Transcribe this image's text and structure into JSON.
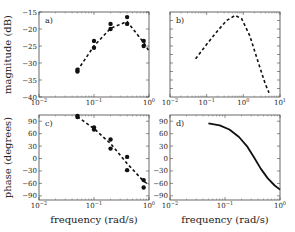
{
  "chart_data": [
    {
      "panel": "a)",
      "type": "scatter",
      "xscale": "log",
      "xlim": [
        0.01,
        1
      ],
      "ylim": [
        -40,
        -15
      ],
      "xticks": [
        "10^-2",
        "10^-1",
        "10^0"
      ],
      "yticks": [
        -40,
        -35,
        -30,
        -25,
        -20,
        -15
      ],
      "ylabel": "magnitude (dB)",
      "xlabel": "",
      "series": [
        {
          "name": "measured",
          "style": "points",
          "x": [
            0.05,
            0.05,
            0.1,
            0.1,
            0.2,
            0.2,
            0.4,
            0.4,
            0.8,
            0.8
          ],
          "y": [
            -32.5,
            -32.0,
            -25.5,
            -23.5,
            -20.0,
            -18.5,
            -16.5,
            -18.5,
            -23.5,
            -25.0
          ]
        },
        {
          "name": "fit",
          "style": "dashed",
          "x": [
            0.05,
            0.1,
            0.2,
            0.4,
            0.8,
            1.0
          ],
          "y": [
            -32.2,
            -25.0,
            -19.8,
            -17.8,
            -24.0,
            -26.5
          ]
        }
      ]
    },
    {
      "panel": "b)",
      "type": "line",
      "xscale": "log",
      "xlim": [
        0.01,
        10
      ],
      "ylim": [
        0,
        1
      ],
      "xticks": [
        "10^-2",
        "10^-1",
        "10^0",
        "10^1"
      ],
      "yticks": [],
      "ylabel": "",
      "xlabel": "",
      "series": [
        {
          "name": "model",
          "style": "dashed",
          "x": [
            0.05,
            0.1,
            0.2,
            0.35,
            0.6,
            0.9,
            1.5,
            2.5,
            4,
            5
          ],
          "y": [
            0.45,
            0.62,
            0.78,
            0.9,
            0.96,
            0.92,
            0.72,
            0.42,
            0.15,
            0.05
          ]
        }
      ]
    },
    {
      "panel": "c)",
      "type": "scatter",
      "xscale": "log",
      "xlim": [
        0.01,
        1
      ],
      "ylim": [
        -100,
        105
      ],
      "xticks": [
        "10^-2",
        "10^-1",
        "10^0"
      ],
      "yticks": [
        90,
        60,
        30,
        0,
        -30,
        -60,
        -90
      ],
      "ylabel": "phase (degrees)",
      "xlabel": "frequency (rad/s)",
      "series": [
        {
          "name": "measured",
          "style": "points",
          "x": [
            0.05,
            0.05,
            0.1,
            0.1,
            0.2,
            0.2,
            0.4,
            0.4,
            0.8,
            0.8
          ],
          "y": [
            103,
            100,
            75,
            70,
            46,
            24,
            4,
            -28,
            -52,
            -70
          ]
        },
        {
          "name": "fit",
          "style": "dashed",
          "x": [
            0.05,
            0.1,
            0.2,
            0.4,
            0.8,
            1.0
          ],
          "y": [
            101,
            72,
            36,
            -12,
            -55,
            -63
          ]
        }
      ]
    },
    {
      "panel": "d)",
      "type": "line",
      "xscale": "log",
      "xlim": [
        0.01,
        1
      ],
      "ylim": [
        -100,
        105
      ],
      "xticks": [
        "10^-2",
        "10^-1",
        "10^0"
      ],
      "yticks": [
        90,
        60,
        30,
        0,
        -30,
        -60,
        -90
      ],
      "ylabel": "",
      "xlabel": "frequency (rad/s)",
      "series": [
        {
          "name": "model",
          "style": "solid",
          "x": [
            0.05,
            0.08,
            0.12,
            0.18,
            0.25,
            0.33,
            0.45,
            0.6,
            0.8,
            1.0
          ],
          "y": [
            85,
            80,
            70,
            52,
            30,
            5,
            -25,
            -48,
            -65,
            -75
          ]
        }
      ]
    }
  ],
  "panels": [
    {
      "label": "a)",
      "box": [
        39,
        12,
        149,
        97
      ]
    },
    {
      "label": "b)",
      "box": [
        170,
        12,
        280,
        97
      ]
    },
    {
      "label": "c)",
      "box": [
        39,
        115,
        149,
        200
      ]
    },
    {
      "label": "d)",
      "box": [
        170,
        115,
        280,
        200
      ]
    }
  ]
}
